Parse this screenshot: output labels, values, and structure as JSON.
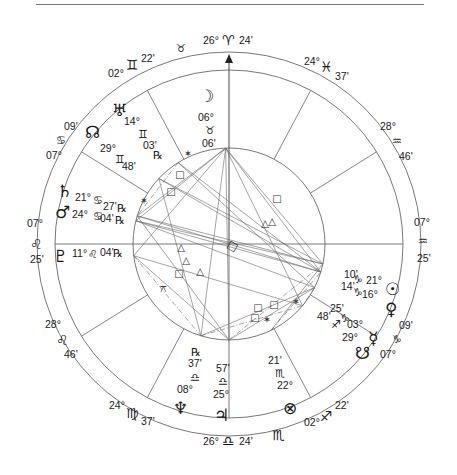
{
  "chart": {
    "axes": {
      "mc": {
        "deg": "26°",
        "sign": "aries",
        "min": "24'"
      },
      "ic": {
        "deg": "26°",
        "sign": "libra",
        "min": "24'"
      },
      "asc": {
        "deg": "07°",
        "sign": "leo",
        "min": "25'"
      },
      "dsc": {
        "deg": "07°",
        "sign": "aquarius",
        "min": "25'"
      }
    },
    "house_cusps": [
      {
        "name": "cusp-gemini",
        "deg": "02°",
        "sign": "gemini",
        "min": "22'"
      },
      {
        "name": "cusp-cancer",
        "deg": "07°",
        "sign": "cancer",
        "min": "09'"
      },
      {
        "name": "cusp-leo-lower",
        "deg": "28°",
        "sign": "leo",
        "min": "46'"
      },
      {
        "name": "cusp-virgo",
        "deg": "24°",
        "sign": "virgo",
        "min": "37'"
      },
      {
        "name": "cusp-sagittarius",
        "deg": "02°",
        "sign": "sagittarius",
        "min": "22'"
      },
      {
        "name": "cusp-capricorn",
        "deg": "07°",
        "sign": "capricorn",
        "min": "09'"
      },
      {
        "name": "cusp-aquarius-upper",
        "deg": "28°",
        "sign": "aquarius",
        "min": "46'"
      },
      {
        "name": "cusp-pisces",
        "deg": "24°",
        "sign": "pisces",
        "min": "37'"
      }
    ],
    "intercepted_signs": [
      "taurus",
      "scorpio"
    ],
    "planets": [
      {
        "name": "moon",
        "deg": "06°",
        "sign": "taurus",
        "min": "06'",
        "retro": ""
      },
      {
        "name": "uranus",
        "deg": "14°",
        "sign": "gemini",
        "min": "03'",
        "retro": "℞"
      },
      {
        "name": "north-node",
        "deg": "29°",
        "sign": "gemini",
        "min": "48'",
        "retro": ""
      },
      {
        "name": "saturn",
        "deg": "21°",
        "sign": "cancer",
        "min": "27'",
        "retro": "℞"
      },
      {
        "name": "mars",
        "deg": "24°",
        "sign": "cancer",
        "min": "04'",
        "retro": "℞"
      },
      {
        "name": "pluto",
        "deg": "11°",
        "sign": "leo",
        "min": "04'",
        "retro": "℞"
      },
      {
        "name": "neptune",
        "deg": "08°",
        "sign": "libra",
        "min": "37'",
        "retro": "℞"
      },
      {
        "name": "jupiter",
        "deg": "25°",
        "sign": "libra",
        "min": "57'",
        "retro": ""
      },
      {
        "name": "part-of-fortune",
        "deg": "22°",
        "sign": "scorpio",
        "min": "21'",
        "retro": ""
      },
      {
        "name": "south-node",
        "deg": "29°",
        "sign": "sagittarius",
        "min": "48'",
        "retro": ""
      },
      {
        "name": "mercury",
        "deg": "03°",
        "sign": "capricorn",
        "min": "25'",
        "retro": ""
      },
      {
        "name": "venus",
        "deg": "16°",
        "sign": "capricorn",
        "min": "14'",
        "retro": ""
      },
      {
        "name": "sun",
        "deg": "21°",
        "sign": "capricorn",
        "min": "10'",
        "retro": ""
      }
    ],
    "glyphs": {
      "aries": "♈",
      "taurus": "♉",
      "gemini": "♊",
      "cancer": "♋",
      "leo": "♌",
      "virgo": "♍",
      "libra": "♎",
      "scorpio": "♏",
      "sagittarius": "♐",
      "capricorn": "♑",
      "aquarius": "♒",
      "pisces": "♓",
      "sun": "☉",
      "moon": "☽",
      "mercury": "☿",
      "venus": "♀",
      "mars": "♂",
      "jupiter": "♃",
      "saturn": "♄",
      "uranus": "♅",
      "neptune": "♆",
      "pluto": "♇",
      "north-node": "☊",
      "south-node": "☋",
      "part-of-fortune": "⊗",
      "square": "□",
      "trine": "△",
      "sextile": "✶",
      "quincunx": "⚻",
      "retro": "℞"
    },
    "aspect_markers": [
      {
        "type": "sextile"
      },
      {
        "type": "square"
      },
      {
        "type": "square"
      },
      {
        "type": "sextile"
      },
      {
        "type": "trine"
      },
      {
        "type": "trine"
      },
      {
        "type": "square"
      },
      {
        "type": "trine"
      },
      {
        "type": "quincunx"
      },
      {
        "type": "square"
      },
      {
        "type": "trine"
      },
      {
        "type": "trine"
      },
      {
        "type": "square"
      },
      {
        "type": "square"
      },
      {
        "type": "sextile"
      },
      {
        "type": "square"
      },
      {
        "type": "sextile"
      }
    ],
    "colors": {
      "ink": "#1a1a1a",
      "line": "#555555",
      "rule": "#777777"
    }
  }
}
